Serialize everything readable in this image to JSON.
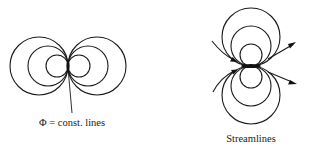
{
  "figure": {
    "potential_panel": {
      "label": "Φ = const. lines",
      "orientation": "horizontal",
      "center": [
        68,
        66
      ],
      "circle_radii": [
        11,
        20,
        29
      ],
      "leader_line": {
        "from": [
          68,
          68
        ],
        "to": [
          72,
          113
        ]
      }
    },
    "streamline_panel": {
      "label": "Streamlines",
      "orientation": "vertical",
      "center": [
        251,
        66
      ],
      "circle_radii": [
        11,
        20,
        29
      ],
      "arrows": [
        {
          "side": "left-upper",
          "direction": "inward"
        },
        {
          "side": "left-lower",
          "direction": "inward"
        },
        {
          "side": "right-upper",
          "direction": "outward"
        },
        {
          "side": "right-lower",
          "direction": "outward"
        }
      ]
    },
    "stroke_color": "#1a1a1a",
    "background_color": "#ffffff"
  }
}
